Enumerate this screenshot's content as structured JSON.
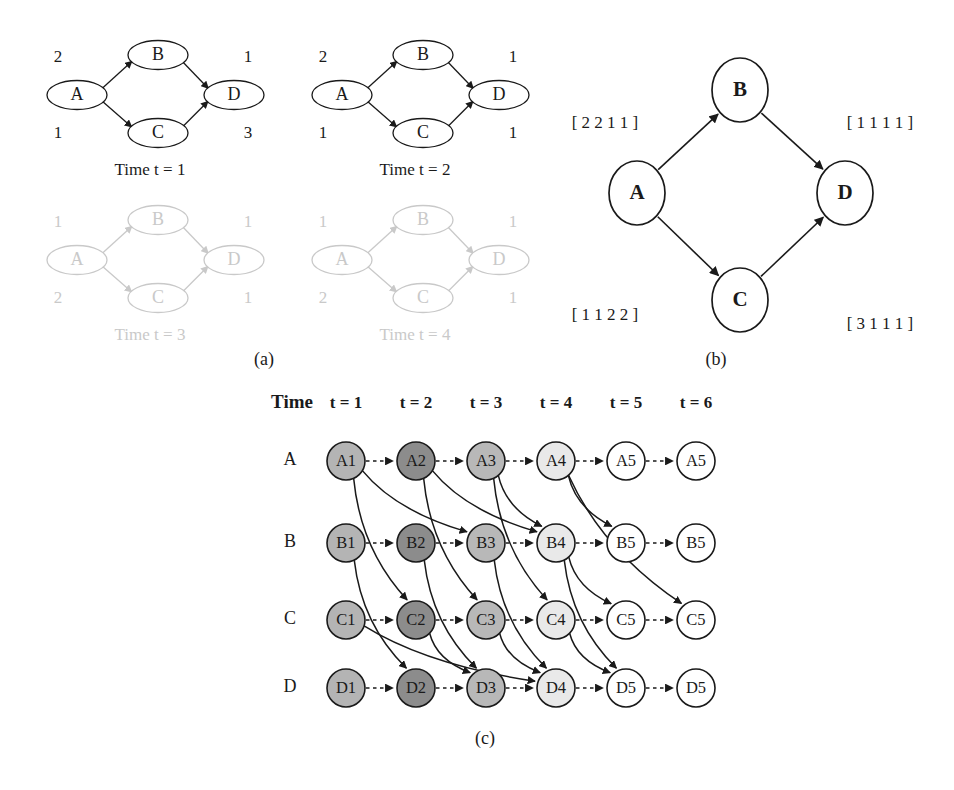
{
  "figure": {
    "caption_a": "(a)",
    "caption_b": "(b)",
    "caption_c": "(c)"
  },
  "panel_a": {
    "snapshots": [
      {
        "caption": "Time t = 1",
        "opacity": "1",
        "nodes": [
          "A",
          "B",
          "C",
          "D"
        ],
        "edge_labels": {
          "ab": "2",
          "ac": "1",
          "bd": "1",
          "cd": "3"
        }
      },
      {
        "caption": "Time t = 2",
        "opacity": "1",
        "nodes": [
          "A",
          "B",
          "C",
          "D"
        ],
        "edge_labels": {
          "ab": "2",
          "ac": "1",
          "bd": "1",
          "cd": "1"
        }
      },
      {
        "caption": "Time t = 3",
        "opacity": "0.28",
        "nodes": [
          "A",
          "B",
          "C",
          "D"
        ],
        "edge_labels": {
          "ab": "1",
          "ac": "2",
          "bd": "1",
          "cd": "1"
        }
      },
      {
        "caption": "Time t = 4",
        "opacity": "0.28",
        "nodes": [
          "A",
          "B",
          "C",
          "D"
        ],
        "edge_labels": {
          "ab": "1",
          "ac": "2",
          "bd": "1",
          "cd": "1"
        }
      }
    ]
  },
  "panel_b": {
    "nodes": {
      "a": "A",
      "b": "B",
      "c": "C",
      "d": "D"
    },
    "edge_vectors": {
      "ab": "[ 2 2 1 1 ]",
      "ac": "[ 1 1 2 2 ]",
      "bd": "[ 1 1 1 1 ]",
      "cd": "[ 3 1 1 1 ]"
    }
  },
  "panel_c": {
    "time_header": "Time",
    "time_columns": [
      "t = 1",
      "t = 2",
      "t = 3",
      "t = 4",
      "t = 5",
      "t = 6"
    ],
    "row_labels": [
      "A",
      "B",
      "C",
      "D"
    ],
    "node_labels": [
      [
        "A1",
        "A2",
        "A3",
        "A4",
        "A5",
        "A5"
      ],
      [
        "B1",
        "B2",
        "B3",
        "B4",
        "B5",
        "B5"
      ],
      [
        "C1",
        "C2",
        "C3",
        "C4",
        "C5",
        "C5"
      ],
      [
        "D1",
        "D2",
        "D3",
        "D4",
        "D5",
        "D5"
      ]
    ],
    "node_fills": [
      [
        "#b4b4b4",
        "#8c8c8c",
        "#b8b8b8",
        "#e9e9e9",
        "#ffffff",
        "#ffffff"
      ],
      [
        "#b4b4b4",
        "#8c8c8c",
        "#b8b8b8",
        "#e9e9e9",
        "#ffffff",
        "#ffffff"
      ],
      [
        "#b4b4b4",
        "#8c8c8c",
        "#b8b8b8",
        "#e9e9e9",
        "#ffffff",
        "#ffffff"
      ],
      [
        "#b4b4b4",
        "#8c8c8c",
        "#b8b8b8",
        "#e9e9e9",
        "#ffffff",
        "#ffffff"
      ]
    ],
    "holdover_edge_style": "dashed",
    "transit_edge_style": "solid-curved",
    "transit_edges": [
      {
        "from": "A1",
        "to": "C2"
      },
      {
        "from": "A1",
        "to": "B3"
      },
      {
        "from": "A2",
        "to": "C3"
      },
      {
        "from": "A2",
        "to": "B4"
      },
      {
        "from": "A3",
        "to": "B4"
      },
      {
        "from": "A3",
        "to": "C4"
      },
      {
        "from": "A4",
        "to": "B5"
      },
      {
        "from": "A4",
        "to": "C6"
      },
      {
        "from": "B1",
        "to": "D2"
      },
      {
        "from": "B2",
        "to": "D3"
      },
      {
        "from": "B3",
        "to": "D4"
      },
      {
        "from": "B4",
        "to": "D5"
      },
      {
        "from": "B4",
        "to": "C5"
      },
      {
        "from": "C1",
        "to": "D4"
      },
      {
        "from": "C2",
        "to": "D3"
      },
      {
        "from": "C3",
        "to": "D4"
      },
      {
        "from": "C4",
        "to": "D5"
      }
    ]
  },
  "colors": {
    "ink": "#1a1a1a",
    "faded_ink": "#c9c9c9",
    "page_background": "#ffffff",
    "node_stroke": "#1a1a1a"
  }
}
